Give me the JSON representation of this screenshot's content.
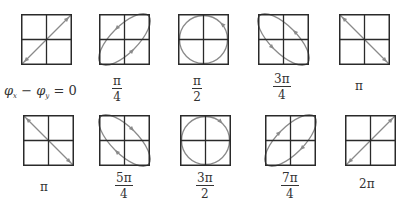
{
  "colors": {
    "grid": "#2a2a2a",
    "curve": "#8a8a8a",
    "background": "#ffffff"
  },
  "panels": [
    {
      "id": "p0",
      "row": 0,
      "x": 21,
      "y": 14,
      "size": 51,
      "phase_label": {
        "type": "equation",
        "lhs_a": "φ",
        "sub_a": "x",
        "op": "−",
        "lhs_b": "φ",
        "sub_b": "y",
        "rhs": "= 0"
      },
      "shape": "line-up",
      "arrows": "both",
      "label_x": 4,
      "label_y": 84
    },
    {
      "id": "p1",
      "row": 0,
      "x": 99,
      "y": 14,
      "size": 51,
      "phase_label": {
        "type": "fraction",
        "num": "π",
        "den": "4"
      },
      "shape": "ellipse-up",
      "arrows": "ccw",
      "label_x": 112,
      "label_y": 75
    },
    {
      "id": "p2",
      "row": 0,
      "x": 178,
      "y": 14,
      "size": 51,
      "phase_label": {
        "type": "fraction",
        "num": "π",
        "den": "2"
      },
      "shape": "circle",
      "arrows": "ccw",
      "label_x": 192,
      "label_y": 75
    },
    {
      "id": "p3",
      "row": 0,
      "x": 258,
      "y": 14,
      "size": 51,
      "phase_label": {
        "type": "fraction",
        "num": "3π",
        "den": "4"
      },
      "shape": "ellipse-down",
      "arrows": "ccw",
      "label_x": 273,
      "label_y": 73
    },
    {
      "id": "p4",
      "row": 0,
      "x": 339,
      "y": 14,
      "size": 51,
      "phase_label": {
        "type": "single",
        "text": "π"
      },
      "shape": "line-down",
      "arrows": "both",
      "label_x": 355,
      "label_y": 80
    },
    {
      "id": "p5",
      "row": 1,
      "x": 23,
      "y": 115,
      "size": 51,
      "phase_label": {
        "type": "single",
        "text": "π"
      },
      "shape": "line-down",
      "arrows": "both",
      "label_x": 40,
      "label_y": 181
    },
    {
      "id": "p6",
      "row": 1,
      "x": 99,
      "y": 115,
      "size": 51,
      "phase_label": {
        "type": "fraction",
        "num": "5π",
        "den": "4"
      },
      "shape": "ellipse-down",
      "arrows": "cw",
      "label_x": 115,
      "label_y": 172
    },
    {
      "id": "p7",
      "row": 1,
      "x": 180,
      "y": 115,
      "size": 51,
      "phase_label": {
        "type": "fraction",
        "num": "3π",
        "den": "2"
      },
      "shape": "circle",
      "arrows": "cw",
      "label_x": 196,
      "label_y": 172
    },
    {
      "id": "p8",
      "row": 1,
      "x": 265,
      "y": 115,
      "size": 51,
      "phase_label": {
        "type": "fraction",
        "num": "7π",
        "den": "4"
      },
      "shape": "ellipse-up",
      "arrows": "cw",
      "label_x": 281,
      "label_y": 172
    },
    {
      "id": "p9",
      "row": 1,
      "x": 345,
      "y": 115,
      "size": 51,
      "phase_label": {
        "type": "single",
        "text": "2π"
      },
      "shape": "line-up",
      "arrows": "both",
      "label_x": 359,
      "label_y": 178
    }
  ]
}
